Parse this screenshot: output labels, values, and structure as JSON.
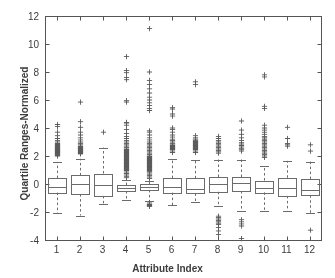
{
  "chart_data": {
    "type": "box",
    "title": "",
    "xlabel": "Attribute Index",
    "ylabel": "Quartile Ranges-Normalized",
    "xlim": [
      0.5,
      12.5
    ],
    "ylim": [
      -4,
      12
    ],
    "ytick_labels": [
      "12",
      "10",
      "8",
      "6",
      "4",
      "2",
      "0",
      "-2",
      "-4"
    ],
    "ytick_values": [
      12,
      10,
      8,
      6,
      4,
      2,
      0,
      -2,
      -4
    ],
    "xtick_labels": [
      "1",
      "2",
      "3",
      "4",
      "5",
      "6",
      "7",
      "8",
      "9",
      "10",
      "11",
      "12"
    ],
    "xtick_values": [
      1,
      2,
      3,
      4,
      5,
      6,
      7,
      8,
      9,
      10,
      11,
      12
    ],
    "grid": false,
    "legend": null,
    "box_color": "#6b6b6b",
    "median_color": "#6b6b6b",
    "whisker_color": "#6b6b6b",
    "outlier_color": "#5a5a5a",
    "outlier_marker": "+",
    "axis_color": "#555555",
    "background": "#ffffff",
    "categories": [
      "1",
      "2",
      "3",
      "4",
      "5",
      "6",
      "7",
      "8",
      "9",
      "10",
      "11",
      "12"
    ],
    "boxes": [
      {
        "index": 1,
        "q1": -0.62,
        "median": -0.18,
        "q3": 0.42,
        "whisker_low": -2.1,
        "whisker_high": 1.55,
        "outliers": [
          2.0,
          2.05,
          2.1,
          2.15,
          2.2,
          2.2,
          2.25,
          2.3,
          2.3,
          2.35,
          2.4,
          2.4,
          2.45,
          2.5,
          2.5,
          2.55,
          2.6,
          2.65,
          2.7,
          2.75,
          2.8,
          2.85,
          2.9,
          3.0,
          3.1,
          3.25,
          3.45,
          3.7,
          4.1,
          4.25
        ]
      },
      {
        "index": 2,
        "q1": -0.72,
        "median": -0.02,
        "q3": 0.62,
        "whisker_low": -2.25,
        "whisker_high": 1.8,
        "outliers": [
          2.15,
          2.2,
          2.25,
          2.3,
          2.35,
          2.4,
          2.45,
          2.5,
          2.55,
          2.6,
          2.65,
          2.7,
          2.8,
          2.9,
          3.0,
          3.15,
          3.3,
          3.5,
          3.7,
          4.05,
          4.45,
          5.85
        ]
      },
      {
        "index": 3,
        "q1": -0.85,
        "median": -0.1,
        "q3": 0.75,
        "whisker_low": -1.45,
        "whisker_high": 2.6,
        "outliers": [
          3.7
        ]
      },
      {
        "index": 4,
        "q1": -0.5,
        "median": -0.3,
        "q3": -0.08,
        "whisker_low": -1.15,
        "whisker_high": 0.3,
        "outliers": [
          0.45,
          0.55,
          0.65,
          0.75,
          0.85,
          0.95,
          1.0,
          1.05,
          1.1,
          1.15,
          1.2,
          1.25,
          1.3,
          1.35,
          1.4,
          1.45,
          1.5,
          1.55,
          1.6,
          1.65,
          1.7,
          1.75,
          1.8,
          1.85,
          1.9,
          1.95,
          2.0,
          2.05,
          2.1,
          2.15,
          2.2,
          2.25,
          2.3,
          2.35,
          2.4,
          2.45,
          2.5,
          2.6,
          2.7,
          2.8,
          2.9,
          3.0,
          3.1,
          3.25,
          3.4,
          3.6,
          3.9,
          4.2,
          4.35,
          4.4,
          5.85,
          5.95,
          7.45,
          7.6,
          7.95,
          8.1,
          9.1
        ]
      },
      {
        "index": 5,
        "q1": -0.42,
        "median": -0.2,
        "q3": -0.02,
        "whisker_low": -1.2,
        "whisker_high": 0.25,
        "outliers": [
          0.4,
          0.5,
          0.6,
          0.7,
          0.8,
          0.9,
          0.95,
          1.0,
          1.05,
          1.1,
          1.15,
          1.2,
          1.25,
          1.3,
          1.35,
          1.4,
          1.45,
          1.5,
          1.55,
          1.6,
          1.65,
          1.7,
          1.75,
          1.8,
          1.85,
          1.9,
          1.95,
          2.0,
          2.1,
          2.2,
          2.3,
          2.4,
          2.5,
          2.6,
          2.7,
          2.8,
          2.9,
          3.0,
          3.15,
          3.3,
          3.5,
          3.7,
          3.8,
          5.25,
          5.4,
          5.6,
          5.8,
          6.0,
          6.2,
          6.5,
          6.8,
          7.1,
          7.4,
          8.0,
          11.1,
          -1.35,
          -1.45,
          -1.5,
          -1.55,
          -1.6
        ]
      },
      {
        "index": 6,
        "q1": -0.62,
        "median": -0.2,
        "q3": 0.42,
        "whisker_low": -1.5,
        "whisker_high": 1.8,
        "outliers": [
          2.25,
          2.35,
          2.45,
          2.5,
          2.55,
          2.6,
          2.65,
          2.7,
          2.75,
          2.8,
          2.9,
          3.0,
          3.1,
          3.2,
          3.35,
          3.5,
          3.7,
          3.9,
          4.0,
          4.85,
          5.0,
          5.35,
          5.45
        ]
      },
      {
        "index": 7,
        "q1": -0.68,
        "median": -0.35,
        "q3": 0.4,
        "whisker_low": -1.3,
        "whisker_high": 1.75,
        "outliers": [
          2.25,
          2.35,
          2.45,
          2.5,
          2.55,
          2.6,
          2.65,
          2.7,
          2.75,
          2.8,
          2.85,
          2.9,
          2.95,
          3.0,
          3.05,
          3.1,
          3.2,
          3.3,
          3.45,
          7.1,
          7.3
        ]
      },
      {
        "index": 8,
        "q1": -0.55,
        "median": 0.0,
        "q3": 0.5,
        "whisker_low": -1.55,
        "whisker_high": 1.75,
        "outliers": [
          2.2,
          2.3,
          2.4,
          2.5,
          2.6,
          2.7,
          2.8,
          2.9,
          3.0,
          3.1,
          3.25,
          3.4,
          -2.3,
          -2.4,
          -2.5,
          -2.6,
          -2.7,
          -2.8,
          -2.9,
          -3.1,
          -3.35,
          -3.6
        ]
      },
      {
        "index": 9,
        "q1": -0.5,
        "median": 0.05,
        "q3": 0.5,
        "whisker_low": -1.95,
        "whisker_high": 1.75,
        "outliers": [
          2.35,
          2.45,
          2.55,
          2.65,
          2.75,
          2.85,
          2.95,
          3.1,
          3.3,
          3.55,
          3.85,
          4.5,
          -2.55,
          -2.7,
          -2.85,
          -3.0,
          -3.9
        ]
      },
      {
        "index": 10,
        "q1": -0.6,
        "median": -0.25,
        "q3": 0.25,
        "whisker_low": -1.95,
        "whisker_high": 1.3,
        "outliers": [
          1.9,
          2.0,
          2.1,
          2.2,
          2.3,
          2.4,
          2.5,
          2.6,
          2.7,
          2.8,
          2.9,
          3.0,
          3.1,
          3.2,
          3.3,
          3.4,
          3.55,
          3.7,
          3.85,
          4.0,
          4.2,
          5.4,
          5.55,
          7.65,
          7.8
        ]
      },
      {
        "index": 11,
        "q1": -0.85,
        "median": -0.3,
        "q3": 0.45,
        "whisker_low": -1.95,
        "whisker_high": 1.65,
        "outliers": [
          2.7,
          2.8,
          2.9,
          3.25,
          4.05
        ]
      },
      {
        "index": 12,
        "q1": -0.8,
        "median": -0.4,
        "q3": 0.35,
        "whisker_low": -2.1,
        "whisker_high": 1.6,
        "outliers": [
          2.35,
          2.8,
          -3.3
        ]
      }
    ]
  },
  "axes": {
    "xlabel": "Attribute Index",
    "ylabel": "Quartile Ranges-Normalized"
  }
}
